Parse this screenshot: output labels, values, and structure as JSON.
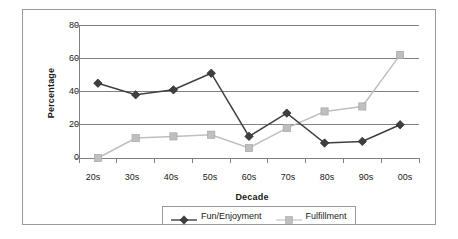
{
  "chart_data": {
    "type": "line",
    "title": "",
    "subtitle": "",
    "xlabel": "Decade",
    "ylabel": "Percentage",
    "categories": [
      "20s",
      "30s",
      "40s",
      "50s",
      "60s",
      "70s",
      "80s",
      "90s",
      "00s"
    ],
    "series": [
      {
        "name": "Fun/Enjoyment",
        "values": [
          45,
          38,
          41,
          51,
          13,
          27,
          9,
          10,
          20
        ],
        "color": "#3f3f3f",
        "marker": "diamond"
      },
      {
        "name": "Fulfillment",
        "values": [
          0,
          12,
          13,
          14,
          6,
          18,
          28,
          31,
          62
        ],
        "color": "#bfbfbf",
        "marker": "square"
      }
    ],
    "ylim": [
      0,
      80
    ],
    "yticks": [
      0,
      20,
      40,
      60,
      80
    ],
    "ytick_labels": [
      "0",
      "20",
      "40",
      "60",
      "80"
    ],
    "grid": "horizontal",
    "legend_position": "bottom",
    "axis_color": "#808080",
    "grid_color": "#808080",
    "background": "#ffffff"
  },
  "legend": {
    "entries": [
      {
        "label": "Fun/Enjoyment"
      },
      {
        "label": "Fulfillment"
      }
    ]
  },
  "axes": {
    "y_title": "Percentage",
    "x_title": "Decade"
  }
}
